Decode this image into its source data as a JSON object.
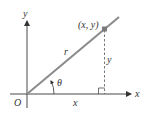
{
  "diagram": {
    "labels": {
      "y_axis": "y",
      "x_axis": "x",
      "origin": "O",
      "point": "(x, y)",
      "radius": "r",
      "vertical_leg": "y",
      "horizontal_leg": "x",
      "angle": "θ"
    },
    "colors": {
      "ray": "#8a8a8a",
      "axes": "#333333",
      "point": "#7a7a7a",
      "dashed": "#555555",
      "text": "#333333"
    }
  }
}
